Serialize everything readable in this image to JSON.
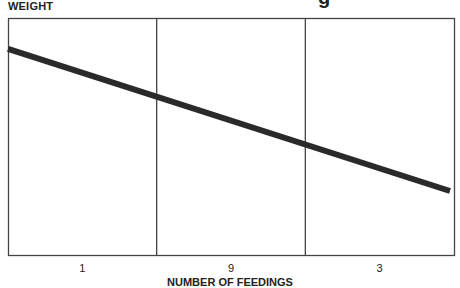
{
  "title_fragment": "g",
  "chart_data": {
    "type": "line",
    "title": "",
    "ylabel": "WEIGHT",
    "xlabel": "NUMBER OF FEEDINGS",
    "categories": [
      "1",
      "9",
      "3"
    ],
    "series": [
      {
        "name": "weight trend",
        "x": [
          0,
          1
        ],
        "y": [
          0.87,
          0.27
        ]
      }
    ],
    "ylim": [
      0,
      1
    ],
    "grid": "vertical dividers between categories",
    "legend": "none"
  }
}
